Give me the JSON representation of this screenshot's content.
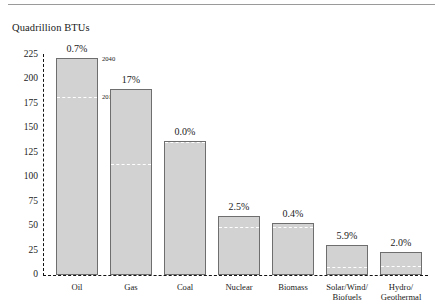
{
  "chart_data": {
    "type": "bar",
    "title": "Quadrillion BTUs",
    "xlabel": "",
    "ylabel": "Quadrillion BTUs",
    "ylim": [
      0,
      225
    ],
    "yticks": [
      0,
      25,
      50,
      75,
      100,
      125,
      150,
      175,
      200,
      225
    ],
    "grid": false,
    "legend_position": "none",
    "categories": [
      "Oil",
      "Gas",
      "Coal",
      "Nuclear",
      "Biomass",
      "Solar/Wind/Biofuels",
      "Hydro/Geothermal"
    ],
    "category_labels": [
      [
        "Oil"
      ],
      [
        "Gas"
      ],
      [
        "Coal"
      ],
      [
        "Nuclear"
      ],
      [
        "Biomass"
      ],
      [
        "Solar/Wind/",
        "Biofuels"
      ],
      [
        "Hydro/",
        "Geothermal"
      ]
    ],
    "series": [
      {
        "name": "2040",
        "values": [
          222,
          190,
          137,
          60,
          53,
          31,
          24
        ]
      },
      {
        "name": "2010",
        "values": [
          183,
          115,
          137,
          50,
          50,
          9,
          10
        ]
      }
    ],
    "data_labels": [
      "0.7%",
      "17%",
      "0.0%",
      "2.5%",
      "0.4%",
      "5.9%",
      "2.0%"
    ],
    "annotations": [
      {
        "text": "2040",
        "series": "2040",
        "category": "Oil"
      },
      {
        "text": "2010",
        "series": "2010",
        "category": "Oil"
      }
    ],
    "colors": {
      "bar_fill": "#d2d2d2",
      "bar_border": "#6e6e6e",
      "reference_line": "#ffffff",
      "axis": "#111111",
      "text": "#1a1a1a"
    }
  }
}
